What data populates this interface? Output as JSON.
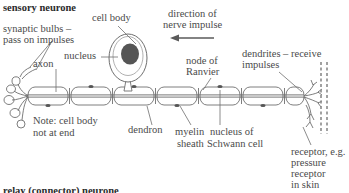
{
  "diagram": {
    "title": "sensory neurone",
    "bottom_partial_title": "relay (connector) neurone",
    "background_color": "#ffffff",
    "ink_color": "#4a4a4a",
    "nucleus_fill": "#555555",
    "axon_fill": "#c9c9c9",
    "labels": {
      "synaptic_bulbs_line1": "synaptic bulbs –",
      "synaptic_bulbs_line2": "pass on impulses",
      "axon": "axon",
      "cell_body": "cell body",
      "nucleus": "nucleus",
      "direction_line1": "direction of",
      "direction_line2": "nerve impulse",
      "node_line1": "node of",
      "node_line2": "Ranvier",
      "dendrites_line1": "dendrites – receive",
      "dendrites_line2": "impulses",
      "note_line1": "Note: cell body",
      "note_line2": "not at end",
      "dendron": "dendron",
      "myelin_line1": "myelin",
      "myelin_line2": "sheath",
      "schwann_line1": "nucleus of",
      "schwann_line2": "Schwann cell",
      "receptor_line1": "receptor, e.g.",
      "receptor_line2": "pressure",
      "receptor_line3": "receptor",
      "receptor_line4": "in skin"
    },
    "impulse_arrow_direction": "left"
  }
}
